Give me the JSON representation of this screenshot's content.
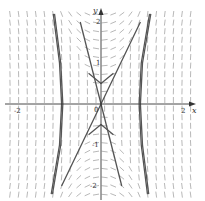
{
  "chart_data": {
    "type": "line",
    "title": "",
    "subtitle": "Slope field with solution curves",
    "xlabel": "x",
    "ylabel": "y",
    "xlim": [
      -2.3,
      2.3
    ],
    "ylim": [
      -2.35,
      2.35
    ],
    "grid": false,
    "legend": "none",
    "x_ticks": [
      {
        "value": -2,
        "label": "-2"
      },
      {
        "value": 2,
        "label": "2"
      }
    ],
    "y_ticks": [
      {
        "value": 2,
        "label": "2"
      },
      {
        "value": 1,
        "label": "1"
      },
      {
        "value": -1,
        "label": "-1"
      },
      {
        "value": -2,
        "label": "-2"
      }
    ],
    "origin_label": "0",
    "series": [
      {
        "name": "left-branch-outer",
        "points": [
          [
            -1.15,
            2.2
          ],
          [
            -1.0,
            1.0
          ],
          [
            -0.95,
            0
          ],
          [
            -1.0,
            -1.0
          ],
          [
            -1.2,
            -2.2
          ]
        ]
      },
      {
        "name": "left-branch-inner",
        "points": [
          [
            -1.12,
            2.2
          ],
          [
            -0.97,
            1.0
          ],
          [
            -0.92,
            0
          ],
          [
            -0.97,
            -1.0
          ],
          [
            -1.17,
            -2.2
          ]
        ]
      },
      {
        "name": "right-branch-outer",
        "points": [
          [
            1.2,
            2.2
          ],
          [
            1.0,
            1.0
          ],
          [
            0.95,
            0
          ],
          [
            1.0,
            -1.0
          ],
          [
            1.15,
            -2.2
          ]
        ]
      },
      {
        "name": "right-branch-inner",
        "points": [
          [
            1.17,
            2.2
          ],
          [
            0.97,
            1.0
          ],
          [
            0.92,
            0
          ],
          [
            0.97,
            -1.0
          ],
          [
            1.12,
            -2.2
          ]
        ]
      },
      {
        "name": "line-positive-slope",
        "points": [
          [
            -0.95,
            -2.0
          ],
          [
            0,
            0
          ],
          [
            0.95,
            2.0
          ]
        ]
      },
      {
        "name": "line-negative-slope",
        "points": [
          [
            -0.5,
            2.0
          ],
          [
            0,
            0
          ],
          [
            0.5,
            -2.0
          ]
        ]
      },
      {
        "name": "upper-curves",
        "points": [
          [
            -0.3,
            0.75
          ],
          [
            0,
            0.5
          ],
          [
            0.3,
            0.75
          ]
        ]
      },
      {
        "name": "lower-curves",
        "points": [
          [
            -0.3,
            -0.75
          ],
          [
            0,
            -0.5
          ],
          [
            0.3,
            -0.75
          ]
        ]
      }
    ],
    "colors": {
      "axis": "#333333",
      "curve": "#555555",
      "field": "#888888"
    }
  }
}
